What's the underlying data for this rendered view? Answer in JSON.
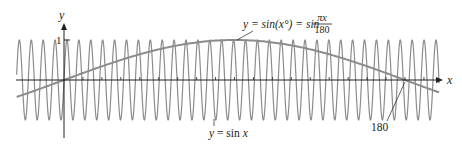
{
  "chart_data": {
    "type": "line",
    "title": "",
    "xlabel": "x",
    "ylabel": "y",
    "xlim": [
      -25,
      198
    ],
    "ylim": [
      -1.15,
      1.15
    ],
    "grid": false,
    "legend": "none",
    "y_ticks": [
      {
        "value": 1,
        "label": "1"
      }
    ],
    "x_ticks": [
      {
        "value": 180,
        "label": "180"
      }
    ],
    "x_minor_tick_step": 10,
    "series": [
      {
        "name": "y = sin x",
        "function": "sin(x)",
        "period": 6.283,
        "amplitude": 1,
        "color": "#8c8c8c"
      },
      {
        "name": "y = sin(x°) = sin πx/180",
        "function": "sin(pi*x/180)",
        "period": 360,
        "amplitude": 1,
        "color": "#8c8c8c",
        "points": [
          {
            "x": -25,
            "y": -0.42
          },
          {
            "x": 0,
            "y": 0
          },
          {
            "x": 45,
            "y": 0.71
          },
          {
            "x": 90,
            "y": 1
          },
          {
            "x": 135,
            "y": 0.71
          },
          {
            "x": 180,
            "y": 0
          },
          {
            "x": 198,
            "y": -0.31
          }
        ]
      }
    ],
    "annotations": [
      {
        "text": "y = sin(x°) = sin πx/180",
        "points_to": "slow curve near x≈90"
      },
      {
        "text": "y = sin x",
        "points_to": "fast oscillating curve"
      },
      {
        "text": "180",
        "points_to": "x-intercept of slow curve"
      }
    ]
  },
  "labels": {
    "y_axis": "y",
    "x_axis": "x",
    "y_one": "1",
    "fast_eq_y": "y",
    "fast_eq_rest": " = sin ",
    "fast_eq_x": "x",
    "slow_eq_left": "y = sin(x°) = sin",
    "slow_frac_num": "πx",
    "slow_frac_den": "180",
    "intercept": "180"
  },
  "colors": {
    "curve": "#8c8c8c",
    "axis": "#231f20",
    "text": "#231f20"
  }
}
